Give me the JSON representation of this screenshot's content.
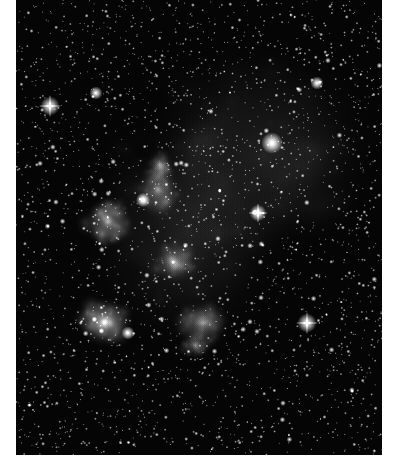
{
  "page": {
    "background": "#ffffff",
    "width": 398,
    "height": 467
  },
  "photo": {
    "subject": "emission-nebula-starfield",
    "mode": "grayscale",
    "frame": {
      "x": 16,
      "y": 0,
      "width": 366,
      "height": 455
    },
    "sky_color": "#050505",
    "star_count": 2600,
    "seed": 6334,
    "nebula_regions": [
      {
        "name": "faint-upper-cloud",
        "cx": 265,
        "cy": 150,
        "rx": 120,
        "ry": 110,
        "intensity": 0.1
      },
      {
        "name": "central-veil",
        "cx": 185,
        "cy": 230,
        "rx": 110,
        "ry": 130,
        "intensity": 0.09
      },
      {
        "name": "upper-lobe",
        "cx": 158,
        "cy": 190,
        "rx": 22,
        "ry": 30,
        "intensity": 0.32
      },
      {
        "name": "upper-lobe-tip",
        "cx": 160,
        "cy": 165,
        "rx": 14,
        "ry": 18,
        "intensity": 0.22
      },
      {
        "name": "left-lobe",
        "cx": 108,
        "cy": 222,
        "rx": 26,
        "ry": 26,
        "intensity": 0.4
      },
      {
        "name": "middle-lobe",
        "cx": 175,
        "cy": 262,
        "rx": 22,
        "ry": 22,
        "intensity": 0.3
      },
      {
        "name": "lower-left-lobe",
        "cx": 105,
        "cy": 322,
        "rx": 30,
        "ry": 26,
        "intensity": 0.48
      },
      {
        "name": "lower-right-lobe",
        "cx": 202,
        "cy": 323,
        "rx": 30,
        "ry": 24,
        "intensity": 0.28
      },
      {
        "name": "lower-right-tail",
        "cx": 196,
        "cy": 345,
        "rx": 18,
        "ry": 14,
        "intensity": 0.22
      }
    ],
    "dark_lanes": [
      {
        "name": "dust-lane-upper",
        "cx": 146,
        "cy": 150,
        "rx": 14,
        "ry": 12,
        "intensity": 0.8
      },
      {
        "name": "dust-lane-between",
        "cx": 135,
        "cy": 270,
        "rx": 20,
        "ry": 18,
        "intensity": 0.5
      }
    ],
    "bright_stars": [
      {
        "name": "bright-star-upper-left",
        "x": 50,
        "y": 106,
        "size": 3.2,
        "spikes": true
      },
      {
        "name": "bright-star-upper-right",
        "x": 272,
        "y": 143,
        "size": 3.6,
        "spikes": false
      },
      {
        "name": "bright-star-center-right",
        "x": 258,
        "y": 213,
        "size": 2.8,
        "spikes": true
      },
      {
        "name": "bright-star-lower-right",
        "x": 307,
        "y": 323,
        "size": 3.2,
        "spikes": true
      },
      {
        "name": "bright-star-left-lobe",
        "x": 143,
        "y": 200,
        "size": 2.4,
        "spikes": false
      },
      {
        "name": "bright-star-lower-lobe",
        "x": 128,
        "y": 333,
        "size": 2.2,
        "spikes": false
      },
      {
        "name": "bright-star-top-left",
        "x": 96,
        "y": 93,
        "size": 2.2,
        "spikes": false
      },
      {
        "name": "bright-star-top-right",
        "x": 317,
        "y": 83,
        "size": 2.2,
        "spikes": false
      }
    ]
  }
}
